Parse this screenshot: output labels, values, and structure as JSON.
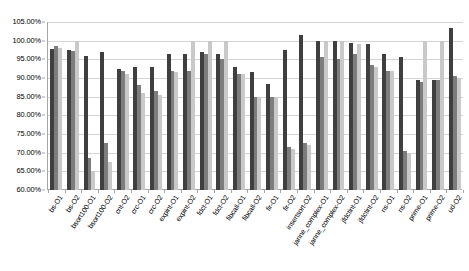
{
  "chart_data": {
    "type": "bar",
    "title": "",
    "subtitle": "",
    "xlabel": "",
    "ylabel": "",
    "ylim": [
      60,
      105
    ],
    "ytick_values": [
      60,
      65,
      70,
      75,
      80,
      85,
      90,
      95,
      100,
      105
    ],
    "ytick_labels": [
      "60.00%",
      "65.00%",
      "70.00%",
      "75.00%",
      "80.00%",
      "85.00%",
      "90.00%",
      "95.00%",
      "100.00%",
      "105.00%"
    ],
    "grid": true,
    "legend": "none",
    "series_colors": [
      "#3f3f3f",
      "#7d7d7d",
      "#c9c9c9"
    ],
    "categories": [
      "bs-O1",
      "bs-O2",
      "bsort100-O1",
      "bsort100-O2",
      "cnt-O2",
      "crc-O1",
      "crc-O2",
      "expint-O1",
      "expint-O2",
      "fdct-O1",
      "fdct-O2",
      "fibcall-O1",
      "fibcall-O2",
      "fir-O1",
      "fir-O2",
      "insertsort-O2",
      "janne_complex-O1",
      "janne_complex-O2",
      "jfdctint-O1",
      "jfdctint-O2",
      "ns-O1",
      "ns-O2",
      "prime-O1",
      "prime-O2",
      "ud-O2"
    ],
    "series": [
      {
        "name": "series-1",
        "values": [
          97.8,
          97.5,
          95.9,
          96.9,
          92.5,
          93.0,
          93.0,
          96.5,
          96.5,
          97.0,
          96.5,
          93.0,
          91.5,
          88.5,
          97.5,
          101.5,
          100.0,
          100.0,
          99.5,
          99.0,
          96.5,
          95.5,
          89.5,
          89.5,
          103.5
        ]
      },
      {
        "name": "series-2",
        "values": [
          98.5,
          97.2,
          68.5,
          72.5,
          92.0,
          88.0,
          86.5,
          92.0,
          92.0,
          96.5,
          95.0,
          91.0,
          85.0,
          85.0,
          71.5,
          72.5,
          95.5,
          95.0,
          96.5,
          93.5,
          92.0,
          70.5,
          89.0,
          89.5,
          90.5
        ]
      },
      {
        "name": "series-3",
        "values": [
          98.0,
          100.0,
          65.0,
          67.5,
          91.0,
          86.0,
          85.5,
          91.5,
          100.0,
          100.0,
          100.0,
          91.0,
          85.0,
          85.0,
          71.0,
          72.0,
          100.0,
          100.0,
          99.0,
          93.0,
          92.0,
          70.0,
          100.0,
          100.0,
          90.0
        ]
      }
    ]
  }
}
